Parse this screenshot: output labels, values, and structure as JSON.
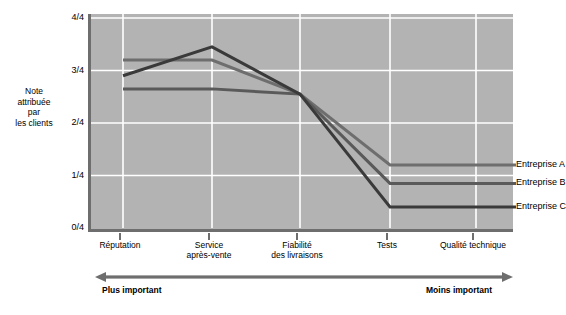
{
  "chart_data": {
    "type": "line",
    "title": "",
    "xlabel": "",
    "ylabel": "Note attribuée par les clients",
    "categories": [
      "Réputation",
      "Service après-vente",
      "Fiabilité des livraisons",
      "Tests",
      "Qualité technique"
    ],
    "ytick_labels": [
      "0/4",
      "1/4",
      "2/4",
      "3/4",
      "4/4"
    ],
    "ytick_values": [
      0,
      1,
      2,
      3,
      4
    ],
    "ylim": [
      0,
      4
    ],
    "grid": true,
    "legend_position": "right",
    "series": [
      {
        "name": "Entreprise A",
        "values": [
          3.2,
          3.2,
          2.55,
          1.2,
          1.2
        ],
        "color": "#6e6e6e"
      },
      {
        "name": "Entreprise B",
        "values": [
          2.65,
          2.65,
          2.55,
          0.85,
          0.85
        ],
        "color": "#5a5a5a"
      },
      {
        "name": "Entreprise C",
        "values": [
          2.9,
          3.45,
          2.55,
          0.4,
          0.4
        ],
        "color": "#3a3a3a"
      }
    ]
  },
  "axis": {
    "y_title_lines": [
      "Note",
      "attribuée",
      "par",
      "les clients"
    ],
    "y_ticks": [
      {
        "label": "4/4",
        "value": 4
      },
      {
        "label": "3/4",
        "value": 3
      },
      {
        "label": "2/4",
        "value": 2
      },
      {
        "label": "1/4",
        "value": 1
      },
      {
        "label": "0/4",
        "value": 0
      }
    ],
    "x_ticks": [
      {
        "lines": [
          "Réputation"
        ]
      },
      {
        "lines": [
          "Service",
          "après-vente"
        ]
      },
      {
        "lines": [
          "Fiabilité",
          "des livraisons"
        ]
      },
      {
        "lines": [
          "Tests"
        ]
      },
      {
        "lines": [
          "Qualité technique"
        ]
      }
    ]
  },
  "legend": {
    "items": [
      {
        "label": "Entreprise A"
      },
      {
        "label": "Entreprise B"
      },
      {
        "label": "Entreprise C"
      }
    ]
  },
  "importance_scale": {
    "left_label": "Plus important",
    "right_label": "Moins important"
  },
  "colors": {
    "plot_background": "#b3b3b3",
    "gridline": "#ffffff",
    "axis_line": "#6e6e6e",
    "series_a": "#6e6e6e",
    "series_b": "#5a5a5a",
    "series_c": "#3a3a3a",
    "arrow": "#6e6e6e",
    "text": "#000000"
  }
}
